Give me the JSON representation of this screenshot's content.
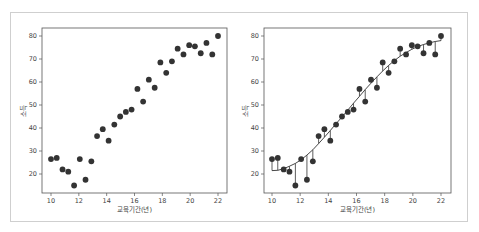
{
  "chart_data": [
    {
      "type": "scatter",
      "title": "",
      "xlabel": "교육기간(년)",
      "ylabel": "소득",
      "xlim": [
        9.4,
        22.6
      ],
      "ylim": [
        12,
        83.5
      ],
      "xticks": [
        10,
        12,
        14,
        16,
        18,
        20,
        22
      ],
      "yticks": [
        20,
        30,
        40,
        50,
        60,
        70,
        80
      ],
      "grid": false,
      "legend": null,
      "x": [
        10.0,
        10.41,
        10.83,
        11.24,
        11.66,
        12.07,
        12.48,
        12.9,
        13.31,
        13.72,
        14.14,
        14.55,
        14.97,
        15.38,
        15.79,
        16.21,
        16.62,
        17.03,
        17.45,
        17.86,
        18.28,
        18.69,
        19.1,
        19.52,
        19.93,
        20.34,
        20.76,
        21.17,
        21.59,
        22.0
      ],
      "y": [
        26.5,
        27.0,
        22.0,
        21.0,
        15.0,
        26.5,
        17.5,
        25.5,
        36.5,
        39.5,
        34.5,
        41.5,
        45.0,
        47.0,
        48.0,
        57.0,
        51.5,
        61.0,
        57.5,
        68.5,
        64.0,
        69.0,
        74.5,
        72.0,
        76.0,
        75.5,
        72.5,
        77.0,
        72.0,
        80.0
      ]
    },
    {
      "type": "scatter",
      "title": "",
      "xlabel": "교육기간(년)",
      "ylabel": "소득",
      "xlim": [
        9.4,
        22.6
      ],
      "ylim": [
        12,
        83.5
      ],
      "xticks": [
        10,
        12,
        14,
        16,
        18,
        20,
        22
      ],
      "yticks": [
        20,
        30,
        40,
        50,
        60,
        70,
        80
      ],
      "grid": false,
      "legend": null,
      "annotations": "fitted sigmoid curve with vertical residual lines from each point to the curve",
      "x": [
        10.0,
        10.41,
        10.83,
        11.24,
        11.66,
        12.07,
        12.48,
        12.9,
        13.31,
        13.72,
        14.14,
        14.55,
        14.97,
        15.38,
        15.79,
        16.21,
        16.62,
        17.03,
        17.45,
        17.86,
        18.28,
        18.69,
        19.1,
        19.52,
        19.93,
        20.34,
        20.76,
        21.17,
        21.59,
        22.0
      ],
      "y": [
        26.5,
        27.0,
        22.0,
        21.0,
        15.0,
        26.5,
        17.5,
        25.5,
        36.5,
        39.5,
        34.5,
        41.5,
        45.0,
        47.0,
        48.0,
        57.0,
        51.5,
        61.0,
        57.5,
        68.5,
        64.0,
        69.0,
        74.5,
        72.0,
        76.0,
        75.5,
        72.5,
        77.0,
        72.0,
        80.0
      ],
      "fit": [
        21.5,
        21.6,
        22.3,
        23.4,
        24.6,
        26.2,
        28.2,
        30.5,
        33.2,
        36.0,
        38.9,
        41.9,
        44.8,
        47.8,
        50.8,
        53.8,
        56.7,
        59.5,
        62.2,
        64.8,
        67.2,
        69.3,
        71.2,
        72.8,
        74.2,
        75.4,
        76.3,
        77.0,
        77.6,
        78.0
      ]
    }
  ],
  "colors": {
    "point": "#333333",
    "line": "#333333",
    "axis": "#555555",
    "border": "#cfcfcf"
  }
}
